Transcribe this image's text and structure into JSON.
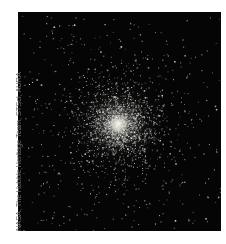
{
  "image": {
    "subject": "globular star cluster",
    "background_color": "#050505",
    "core_color": "#f4f1ea",
    "star_color": "#d9d9d9",
    "core_center_x": 118,
    "core_center_y": 124
  },
  "credit": {
    "text": "NASA, The Hubble Heritage Team, STScI, AURA"
  }
}
